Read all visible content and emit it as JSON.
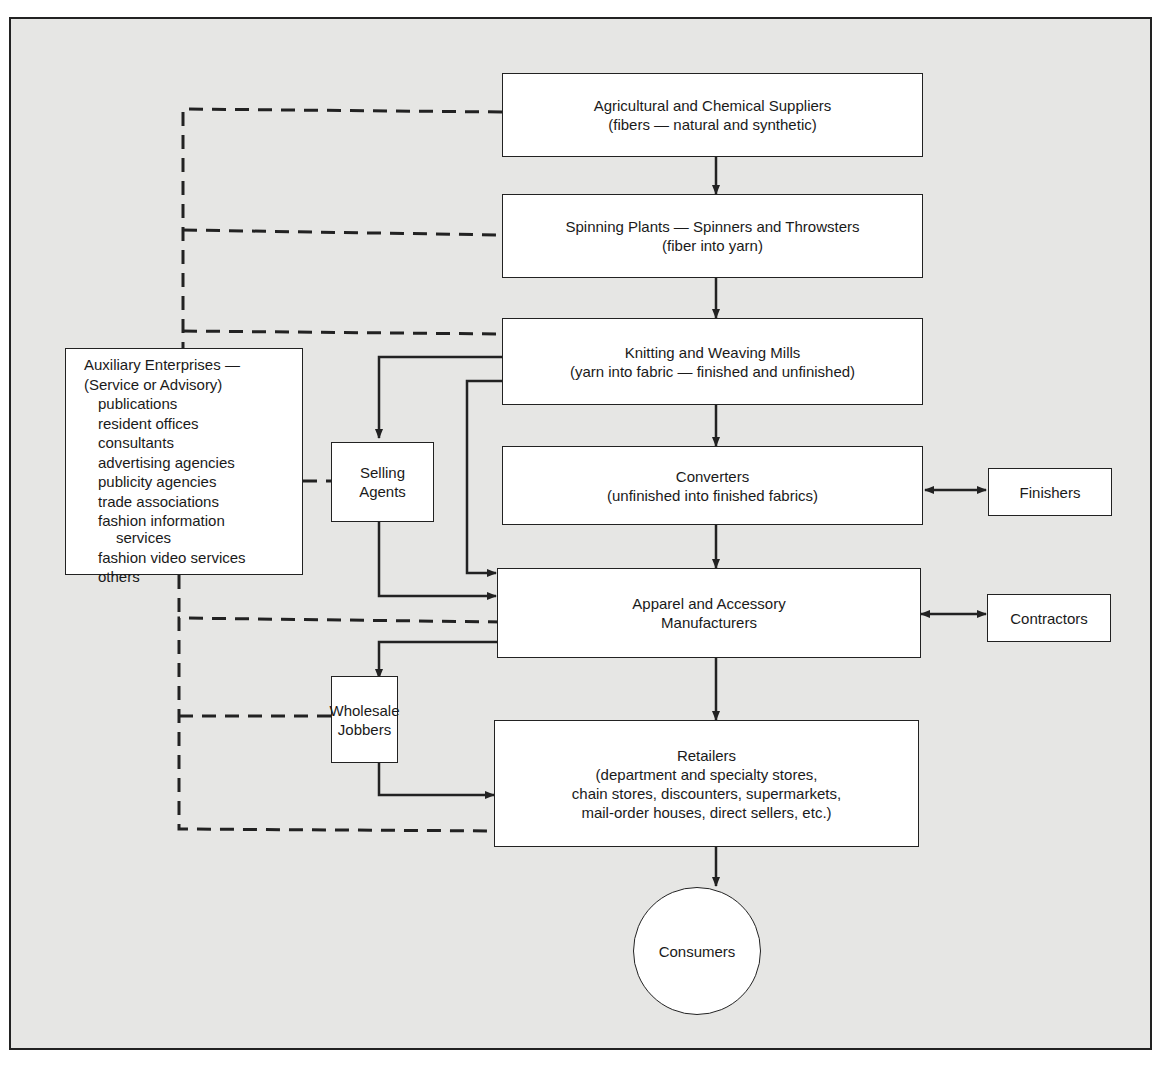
{
  "diagram": {
    "type": "flow chart",
    "main_chain": [
      {
        "id": "suppliers",
        "line1": "Agricultural and Chemical Suppliers",
        "line2": "(fibers — natural and synthetic)"
      },
      {
        "id": "spinning",
        "line1": "Spinning Plants — Spinners and Throwsters",
        "line2": "(fiber into yarn)"
      },
      {
        "id": "mills",
        "line1": "Knitting and Weaving Mills",
        "line2": "(yarn into fabric — finished and unfinished)"
      },
      {
        "id": "converters",
        "line1": "Converters",
        "line2": "(unfinished into finished fabrics)"
      },
      {
        "id": "apparel",
        "line1": "Apparel and Accessory",
        "line2": "Manufacturers"
      },
      {
        "id": "retailers",
        "line1": "Retailers",
        "line2": "(department and specialty stores,",
        "line3": "chain stores, discounters, supermarkets,",
        "line4": "mail-order houses, direct sellers, etc.)"
      }
    ],
    "consumers": "Consumers",
    "side_nodes": {
      "finishers": "Finishers",
      "contractors": "Contractors",
      "selling_agents": {
        "line1": "Selling",
        "line2": "Agents"
      },
      "wholesale_jobbers": {
        "line1": "Wholesale",
        "line2": "Jobbers"
      }
    },
    "auxiliary": {
      "title1": "Auxiliary Enterprises —",
      "title2": "(Service or Advisory)",
      "items": [
        "publications",
        "resident offices",
        "consultants",
        "advertising agencies",
        "publicity agencies",
        "trade associations",
        "fashion information",
        "services",
        "fashion video services",
        "others"
      ]
    },
    "edges": [
      {
        "from": "suppliers",
        "to": "spinning",
        "style": "solid-arrow"
      },
      {
        "from": "spinning",
        "to": "mills",
        "style": "solid-arrow"
      },
      {
        "from": "mills",
        "to": "converters",
        "style": "solid-arrow"
      },
      {
        "from": "mills",
        "to": "selling_agents",
        "style": "solid-arrow"
      },
      {
        "from": "mills",
        "to": "apparel",
        "style": "solid-arrow"
      },
      {
        "from": "selling_agents",
        "to": "apparel",
        "style": "solid-arrow"
      },
      {
        "from": "converters",
        "to": "apparel",
        "style": "solid-arrow"
      },
      {
        "from": "converters",
        "to": "finishers",
        "style": "double-arrow"
      },
      {
        "from": "apparel",
        "to": "contractors",
        "style": "double-arrow"
      },
      {
        "from": "apparel",
        "to": "wholesale_jobbers",
        "style": "solid-arrow"
      },
      {
        "from": "apparel",
        "to": "retailers",
        "style": "solid-arrow"
      },
      {
        "from": "wholesale_jobbers",
        "to": "retailers",
        "style": "solid-arrow"
      },
      {
        "from": "retailers",
        "to": "consumers",
        "style": "solid-arrow"
      },
      {
        "from": "auxiliary",
        "to": "suppliers",
        "style": "dashed"
      },
      {
        "from": "auxiliary",
        "to": "spinning",
        "style": "dashed"
      },
      {
        "from": "auxiliary",
        "to": "mills",
        "style": "dashed"
      },
      {
        "from": "auxiliary",
        "to": "selling_agents",
        "style": "dashed"
      },
      {
        "from": "auxiliary",
        "to": "apparel",
        "style": "dashed"
      },
      {
        "from": "auxiliary",
        "to": "wholesale_jobbers",
        "style": "dashed"
      },
      {
        "from": "auxiliary",
        "to": "retailers",
        "style": "dashed"
      }
    ]
  },
  "colors": {
    "panel": "#e6e6e4",
    "box": "#ffffff",
    "line": "#222222"
  }
}
